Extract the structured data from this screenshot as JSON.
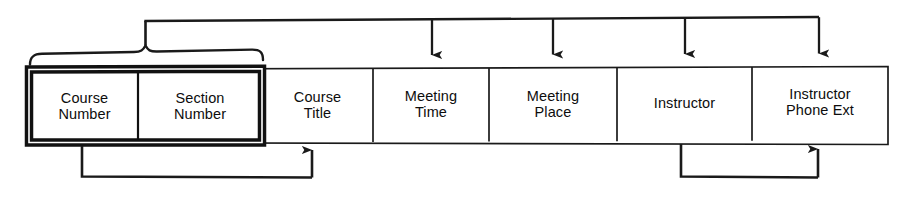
{
  "diagram": {
    "type": "functional-dependency-diagram",
    "title_visible": false,
    "colors": {
      "background": "#ffffff",
      "line": "#1a1a1a",
      "text": "#0d0d0d",
      "key_border": "#111111"
    },
    "relation": {
      "name_visible": false,
      "attributes": [
        {
          "id": "course-number",
          "label": "Course\nNumber",
          "is_key": true,
          "x": 31,
          "width": 107
        },
        {
          "id": "section-number",
          "label": "Section\nNumber",
          "is_key": true,
          "x": 138,
          "width": 120
        },
        {
          "id": "course-title",
          "label": "Course\nTitle",
          "is_key": false,
          "x": 262,
          "width": 111
        },
        {
          "id": "meeting-time",
          "label": "Meeting\nTime",
          "is_key": false,
          "x": 373,
          "width": 116
        },
        {
          "id": "meeting-place",
          "label": "Meeting\nPlace",
          "is_key": false,
          "x": 489,
          "width": 128
        },
        {
          "id": "instructor",
          "label": "Instructor",
          "is_key": false,
          "x": 617,
          "width": 135
        },
        {
          "id": "instructor-phone-ext",
          "label": "Instructor\nPhone Ext",
          "is_key": false,
          "x": 752,
          "width": 136
        }
      ]
    },
    "composite_key": {
      "members": [
        "course-number",
        "section-number"
      ],
      "brace_label": ""
    },
    "dependencies": [
      {
        "id": "fd-key-to-meeting-time",
        "from": "composite-key",
        "to": "meeting-time",
        "route": "above"
      },
      {
        "id": "fd-key-to-meeting-place",
        "from": "composite-key",
        "to": "meeting-place",
        "route": "above"
      },
      {
        "id": "fd-key-to-instructor",
        "from": "composite-key",
        "to": "instructor",
        "route": "above"
      },
      {
        "id": "fd-key-to-instructor-phone-ext",
        "from": "composite-key",
        "to": "instructor-phone-ext",
        "route": "above"
      },
      {
        "id": "fd-course-number-to-course-title",
        "from": "course-number",
        "to": "course-title",
        "route": "below"
      },
      {
        "id": "fd-instructor-to-instructor-phone-ext",
        "from": "instructor",
        "to": "instructor-phone-ext",
        "route": "below"
      }
    ]
  }
}
